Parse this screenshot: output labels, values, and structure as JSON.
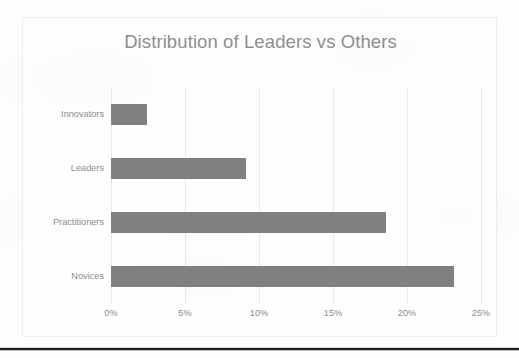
{
  "chart_data": {
    "type": "bar",
    "orientation": "horizontal",
    "title": "Distribution of Leaders vs Others",
    "xlabel": "",
    "ylabel": "",
    "categories": [
      "Novices",
      "Practitioners",
      "Leaders",
      "Innovators"
    ],
    "values": [
      23.2,
      18.6,
      9.1,
      2.4
    ],
    "value_unit": "%",
    "xlim": [
      0,
      25
    ],
    "xticks": [
      0,
      5,
      10,
      15,
      20,
      25
    ],
    "xtick_labels": [
      "0%",
      "5%",
      "10%",
      "15%",
      "20%",
      "25%"
    ],
    "display_order_top_to_bottom": [
      "Innovators",
      "Leaders",
      "Practitioners",
      "Novices"
    ],
    "grid": "vertical",
    "legend": "none",
    "bar_color": "#808080",
    "title_color": "#8e8e90",
    "label_color": "#8c8c8e",
    "gridline_color": "#e8e8ea",
    "frame_border_color": "#ededef",
    "bars": [
      {
        "label": "Innovators",
        "value": 2.4,
        "value_label": "2.4%"
      },
      {
        "label": "Leaders",
        "value": 9.1,
        "value_label": "9.1%"
      },
      {
        "label": "Practitioners",
        "value": 18.6,
        "value_label": "18.6%"
      },
      {
        "label": "Novices",
        "value": 23.2,
        "value_label": "23.2%"
      }
    ]
  }
}
